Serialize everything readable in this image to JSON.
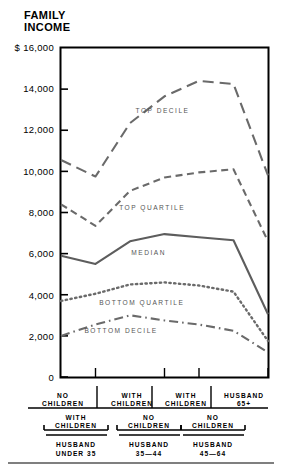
{
  "title": {
    "line1": "FAMILY",
    "line2": "INCOME"
  },
  "chart_data": {
    "type": "line",
    "title": "FAMILY INCOME",
    "xlabel": "",
    "ylabel": "FAMILY INCOME",
    "ylim": [
      0,
      16000
    ],
    "grid": false,
    "legend_position": "inline-labels",
    "ytick_labels": [
      "$ 16,000",
      "14,000",
      "12,000",
      "10,000",
      "8,000",
      "6,000",
      "4,000",
      "2,000",
      "0"
    ],
    "ytick_values": [
      16000,
      14000,
      12000,
      10000,
      8000,
      6000,
      4000,
      2000,
      0
    ],
    "categories": [
      "NO CHILDREN / WITH CHILDREN / HUSBAND UNDER 35",
      "WITH CHILDREN / WITH CHILDREN / HUSBAND UNDER 35",
      "WITH CHILDREN / NO CHILDREN / HUSBAND 35-44",
      "NO CHILDREN / NO CHILDREN / HUSBAND 35-44",
      "WITH CHILDREN / NO CHILDREN / HUSBAND 45-64",
      "NO CHILDREN / NO CHILDREN / HUSBAND 45-64",
      "HUSBAND 65+"
    ],
    "x": [
      0,
      1,
      2,
      3,
      4,
      5,
      6
    ],
    "series": [
      {
        "name": "TOP DECILE",
        "style": "long-dash",
        "values": [
          10550,
          9750,
          12350,
          13650,
          14400,
          14250,
          9800
        ]
      },
      {
        "name": "TOP QUARTILE",
        "style": "dashed",
        "values": [
          8400,
          7350,
          9050,
          9700,
          9950,
          10100,
          6600
        ]
      },
      {
        "name": "MEDIAN",
        "style": "solid",
        "values": [
          5900,
          5500,
          6600,
          6950,
          6800,
          6650,
          3050
        ]
      },
      {
        "name": "BOTTOM QUARTILE",
        "style": "dotted",
        "values": [
          3700,
          4050,
          4500,
          4600,
          4450,
          4150,
          1750
        ]
      },
      {
        "name": "BOTTOM DECILE",
        "style": "dash-dot",
        "values": [
          2000,
          2550,
          3000,
          2750,
          2550,
          2250,
          1200
        ]
      }
    ],
    "annotations": [
      {
        "text": "TOP DECILE",
        "x": 3.0,
        "y": 12900
      },
      {
        "text": "TOP QUARTILE",
        "x": 2.7,
        "y": 8150
      },
      {
        "text": "MEDIAN",
        "x": 2.6,
        "y": 6000
      },
      {
        "text": "BOTTOM QUARTILE",
        "x": 2.4,
        "y": 3550
      },
      {
        "text": "BOTTOM DECILE",
        "x": 1.8,
        "y": 2200
      }
    ]
  },
  "axis": {
    "categories_row": [
      {
        "line1": "NO",
        "line2": "CHILDREN"
      },
      {
        "line1": "WITH",
        "line2": "CHILDREN"
      },
      {
        "line1": "WITH",
        "line2": "CHILDREN"
      },
      {
        "line1": "HUSBAND",
        "line2": "65+"
      }
    ],
    "groups_row": [
      {
        "line1": "WITH",
        "line2": "CHILDREN"
      },
      {
        "line1": "NO",
        "line2": "CHILDREN"
      },
      {
        "line1": "NO",
        "line2": "CHILDREN"
      }
    ],
    "ages_row": [
      {
        "line1": "HUSBAND",
        "line2": "UNDER 35"
      },
      {
        "line1": "HUSBAND",
        "line2": "35—44"
      },
      {
        "line1": "HUSBAND",
        "line2": "45—64"
      }
    ]
  },
  "colors": {
    "axis": "#000000",
    "series_line": "#6a6a6a",
    "median_line": "#5d5d5d",
    "label_text": "#555555",
    "background": "#ffffff"
  }
}
